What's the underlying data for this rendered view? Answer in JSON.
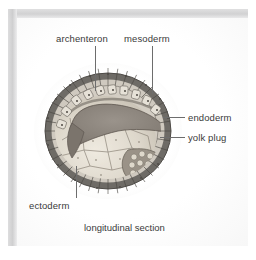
{
  "figure": {
    "caption": "longitudinal section",
    "labels": [
      {
        "id": "archenteron",
        "text": "archenteron"
      },
      {
        "id": "mesoderm",
        "text": "mesoderm"
      },
      {
        "id": "endoderm",
        "text": "endoderm"
      },
      {
        "id": "yolk-plug",
        "text": "yolk plug"
      },
      {
        "id": "ectoderm",
        "text": "ectoderm"
      }
    ],
    "colors": {
      "frame": "#cfcfd0",
      "panel_background": "#fdfdfd",
      "text": "#3a3a3a",
      "leader_line": "#6d6d6d",
      "ectoderm_outer": "#6d6a66",
      "ectoderm_cells": "#cfc9bf",
      "archenteron_cavity": "#8b857e",
      "endoderm_yolk": "#d8d3c8",
      "yolk_plug": "#9a9287"
    }
  }
}
